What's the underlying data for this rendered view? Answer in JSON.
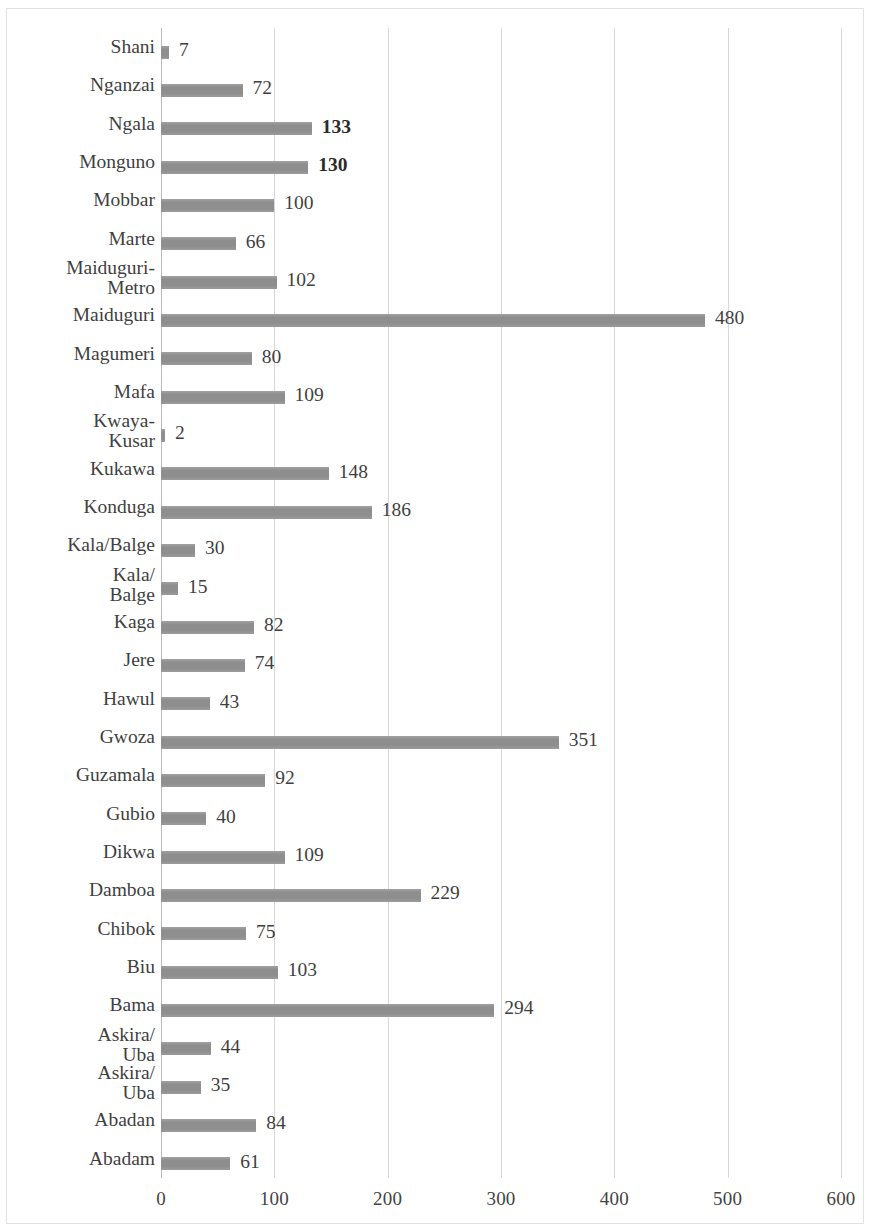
{
  "chart_data": {
    "type": "bar",
    "orientation": "horizontal",
    "title": "",
    "subtitle": "",
    "xlabel": "",
    "ylabel": "",
    "xlim": [
      0,
      600
    ],
    "ylim": null,
    "grid": true,
    "legend": null,
    "legend_position": "none",
    "bar_color": "#8e8e8e",
    "gridline_color": "#d8d8d8",
    "axis_color": "#b9b9b9",
    "xticks": [
      0,
      100,
      200,
      300,
      400,
      500,
      600
    ],
    "xtick_labels": [
      "0",
      "100",
      "200",
      "300",
      "400",
      "500",
      "600"
    ],
    "categories": [
      "Shani",
      "Nganzai",
      "Ngala",
      "Monguno",
      "Mobbar",
      "Marte",
      "Maiduguri-\nMetro",
      "Maiduguri",
      "Magumeri",
      "Mafa",
      "Kwaya-\nKusar",
      "Kukawa",
      "Konduga",
      "Kala/Balge",
      "Kala/\nBalge",
      "Kaga",
      "Jere",
      "Hawul",
      "Gwoza",
      "Guzamala",
      "Gubio",
      "Dikwa",
      "Damboa",
      "Chibok",
      "Biu",
      "Bama",
      "Askira/\nUba",
      "Askira/\nUba",
      "Abadan",
      "Abadam"
    ],
    "values": [
      7,
      72,
      133,
      130,
      100,
      66,
      102,
      480,
      80,
      109,
      2,
      148,
      186,
      30,
      15,
      82,
      74,
      43,
      351,
      92,
      40,
      109,
      229,
      75,
      103,
      294,
      44,
      35,
      84,
      61
    ],
    "value_labels": [
      "7",
      "72",
      "133",
      "130",
      "100",
      "66",
      "102",
      "480",
      "80",
      "109",
      "2",
      "148",
      "186",
      "30",
      "15",
      "82",
      "74",
      "43",
      "351",
      "92",
      "40",
      "109",
      "229",
      "75",
      "103",
      "294",
      "44",
      "35",
      "84",
      "61"
    ],
    "bold_value_labels": [
      "133",
      "130"
    ],
    "multiline_categories": [
      "Maiduguri-\nMetro",
      "Kwaya-\nKusar",
      "Kala/\nBalge",
      "Askira/\nUba"
    ]
  }
}
